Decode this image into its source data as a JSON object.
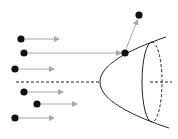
{
  "diagram": {
    "title": "",
    "colors": {
      "particle": "#111111",
      "arrow": "#a8a8a8",
      "surface": "#222222",
      "axis": "#222222"
    },
    "incoming_particles": [
      {
        "x": 21,
        "y": 39,
        "arrow_end_x": 59
      },
      {
        "x": 24,
        "y": 53,
        "arrow_end_x": 121
      },
      {
        "x": 15,
        "y": 69,
        "arrow_end_x": 54
      },
      {
        "x": 24,
        "y": 92,
        "arrow_end_x": 63
      },
      {
        "x": 37,
        "y": 104,
        "arrow_end_x": 77
      },
      {
        "x": 15,
        "y": 118,
        "arrow_end_x": 54
      }
    ],
    "impact_particle": {
      "x": 125,
      "y": 53
    },
    "deflected_particle": {
      "x": 139,
      "y": 15
    },
    "axis": {
      "y": 82,
      "x_start": 16,
      "x_vertex": 100,
      "x_end": 172
    },
    "paraboloid": {
      "vertex_x": 100,
      "vertex_y": 82,
      "top_x": 166,
      "top_y": 37,
      "bottom_x": 166,
      "bottom_y": 128
    },
    "rim_ellipse": {
      "cx": 152,
      "cy": 82,
      "rx": 10,
      "ry": 40
    }
  }
}
